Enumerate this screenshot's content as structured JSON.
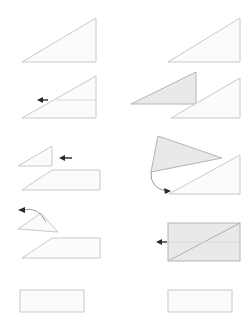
{
  "document": {
    "title": "Paper Folding Instruction Sequence",
    "type": "step-by-step-fold-diagram",
    "canvas": {
      "width": 252,
      "height": 329
    },
    "background_color": "#ffffff",
    "rows": 5,
    "columns": 2
  },
  "style": {
    "face_light_fill": "#fbfbfb",
    "face_light_stroke": "#c9c9c9",
    "face_shaded_fill": "#e9e9e9",
    "face_shaded_stroke": "#b4b4b4",
    "fold_line_color": "#d8d8d8",
    "crease_line_color": "#b0b0b0",
    "arrow_color": "#2b2b2b",
    "arrow_curve_color": "#9a9a9a",
    "stroke_width": 1
  },
  "chart_data": {
    "type": "diagram",
    "panel_count": 10,
    "panels": [
      {
        "id": "panel-1-left",
        "step": 1,
        "column": "left",
        "row": 1,
        "description": "Right triangle, hypotenuse rising to the right, unshaded",
        "shapes": [
          {
            "name": "triangle-outline",
            "kind": "triangle",
            "fill": "light",
            "points": "22,62 96,62 96,18"
          }
        ],
        "arrows": []
      },
      {
        "id": "panel-1-right",
        "step": 2,
        "column": "right",
        "row": 1,
        "description": "Identical right triangle shown on the right column",
        "shapes": [
          {
            "name": "triangle-outline",
            "kind": "triangle",
            "fill": "light",
            "points": "168,62 240,62 240,18"
          }
        ],
        "arrows": []
      },
      {
        "id": "panel-2-left",
        "step": 3,
        "column": "left",
        "row": 2,
        "description": "Right triangle with a horizontal crease line and a left-pointing arrow at the crease",
        "shapes": [
          {
            "name": "triangle-outline",
            "kind": "triangle",
            "fill": "light",
            "points": "22,118 96,118 96,76"
          },
          {
            "name": "crease-line",
            "kind": "line",
            "points": "56,100 96,100"
          }
        ],
        "arrows": [
          {
            "name": "fold-arrow-left",
            "kind": "straight",
            "direction": "left",
            "from": "48,100",
            "to": "37,100"
          }
        ]
      },
      {
        "id": "panel-2-right",
        "step": 4,
        "column": "right",
        "row": 2,
        "description": "Shaded triangle pointing right overlapping a lighter triangle offset down-right",
        "shapes": [
          {
            "name": "triangle-shaded",
            "kind": "triangle",
            "fill": "shaded",
            "points": "131,104 196,104 196,72"
          },
          {
            "name": "triangle-light",
            "kind": "triangle",
            "fill": "light",
            "points": "171,118 240,118 240,78"
          }
        ],
        "arrows": []
      },
      {
        "id": "panel-3-left",
        "step": 5,
        "column": "left",
        "row": 3,
        "description": "Small right triangle with left-pointing arrow beside it, above a trapezoid",
        "shapes": [
          {
            "name": "triangle-small",
            "kind": "triangle",
            "fill": "light",
            "points": "18,166 52,166 52,146"
          },
          {
            "name": "trapezoid",
            "kind": "polygon",
            "fill": "light",
            "points": "22,190 52,170 100,170 100,190"
          }
        ],
        "arrows": [
          {
            "name": "fold-arrow-left",
            "kind": "straight",
            "direction": "left",
            "from": "72,158",
            "to": "59,158"
          }
        ]
      },
      {
        "id": "panel-3-right",
        "step": 6,
        "column": "right",
        "row": 3,
        "description": "Rotated shaded triangle lifted away with a curved arrow looping down to a light triangle below",
        "shapes": [
          {
            "name": "triangle-shaded-rotated",
            "kind": "triangle",
            "fill": "shaded",
            "points": "151,172 158,136 222,158"
          },
          {
            "name": "triangle-light",
            "kind": "triangle",
            "fill": "light",
            "points": "169,194 240,194 240,155"
          }
        ],
        "arrows": [
          {
            "name": "fold-arrow-curved-down",
            "kind": "curved",
            "direction": "down-right",
            "path": "M151,172 Q150,188 166,191"
          }
        ]
      },
      {
        "id": "panel-4-left",
        "step": 7,
        "column": "left",
        "row": 4,
        "description": "Small rotated triangle with curved arrow above pointing left, trapezoid below",
        "shapes": [
          {
            "name": "triangle-rotated",
            "kind": "triangle",
            "fill": "light",
            "points": "18,229 41,213 58,232"
          },
          {
            "name": "trapezoid",
            "kind": "polygon",
            "fill": "light",
            "points": "22,258 52,238 100,238 100,258"
          }
        ],
        "arrows": [
          {
            "name": "fold-arrow-curved-left",
            "kind": "curved",
            "direction": "up-left",
            "path": "M46,222 Q38,206 23,210"
          }
        ]
      },
      {
        "id": "panel-4-right",
        "step": 8,
        "column": "right",
        "row": 4,
        "description": "Shaded rectangle crossed by a diagonal crease with a left-pointing arrow at the mid-height",
        "shapes": [
          {
            "name": "rectangle-shaded",
            "kind": "rect",
            "fill": "shaded",
            "x": 168,
            "y": 223,
            "width": 72,
            "height": 38
          },
          {
            "name": "diagonal-crease",
            "kind": "line",
            "points": "168,261 240,223"
          },
          {
            "name": "mid-line",
            "kind": "line",
            "points": "168,242 240,242"
          }
        ],
        "arrows": [
          {
            "name": "fold-arrow-left",
            "kind": "straight",
            "direction": "left",
            "from": "167,242",
            "to": "156,242"
          }
        ]
      },
      {
        "id": "panel-5-left",
        "step": 9,
        "column": "left",
        "row": 5,
        "description": "Finished flat rectangle, unshaded",
        "shapes": [
          {
            "name": "rectangle-result",
            "kind": "rect",
            "fill": "light",
            "x": 20,
            "y": 290,
            "width": 64,
            "height": 22
          }
        ],
        "arrows": []
      },
      {
        "id": "panel-5-right",
        "step": 10,
        "column": "right",
        "row": 5,
        "description": "Finished flat rectangle, unshaded, right column",
        "shapes": [
          {
            "name": "rectangle-result",
            "kind": "rect",
            "fill": "light",
            "x": 168,
            "y": 290,
            "width": 64,
            "height": 22
          }
        ],
        "arrows": []
      }
    ]
  }
}
